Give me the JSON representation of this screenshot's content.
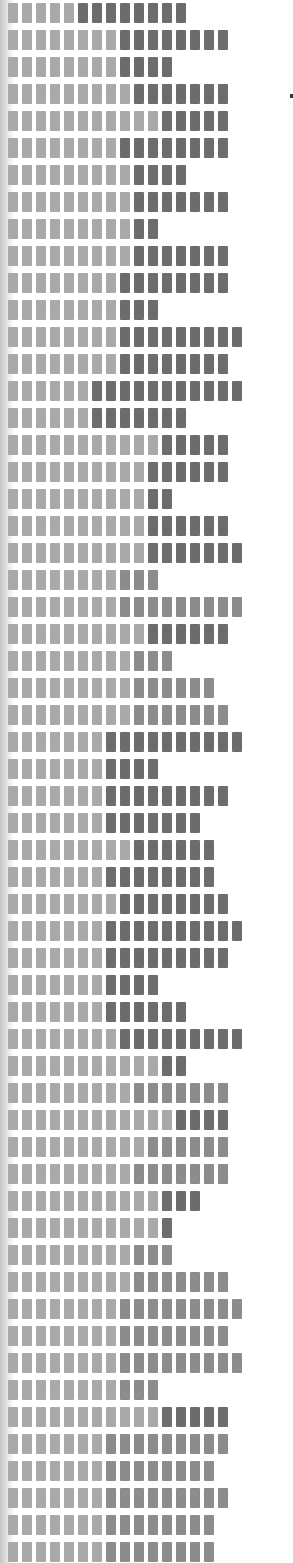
{
  "colors": {
    "light": "#a9a9a9",
    "mid": "#8c8c8c",
    "dark": "#6c6c6c",
    "background": "#ffffff"
  },
  "layout": {
    "row_pitch": 27,
    "first_row_top": 3,
    "block_width": 10,
    "block_height": 20,
    "block_gap": 4
  },
  "rows": [
    {
      "light": 5,
      "dark": 8,
      "tone": "dark"
    },
    {
      "light": 8,
      "dark": 8,
      "tone": "dark"
    },
    {
      "light": 8,
      "dark": 4,
      "tone": "dark"
    },
    {
      "light": 9,
      "dark": 7,
      "tone": "dark"
    },
    {
      "light": 11,
      "dark": 5,
      "tone": "dark"
    },
    {
      "light": 8,
      "dark": 8,
      "tone": "dark"
    },
    {
      "light": 9,
      "dark": 4,
      "tone": "dark"
    },
    {
      "light": 9,
      "dark": 7,
      "tone": "dark"
    },
    {
      "light": 9,
      "dark": 2,
      "tone": "dark"
    },
    {
      "light": 9,
      "dark": 7,
      "tone": "dark"
    },
    {
      "light": 8,
      "dark": 8,
      "tone": "dark"
    },
    {
      "light": 8,
      "dark": 3,
      "tone": "dark"
    },
    {
      "light": 8,
      "dark": 9,
      "tone": "dark"
    },
    {
      "light": 8,
      "dark": 8,
      "tone": "dark"
    },
    {
      "light": 6,
      "dark": 11,
      "tone": "dark"
    },
    {
      "light": 6,
      "dark": 7,
      "tone": "dark"
    },
    {
      "light": 11,
      "dark": 5,
      "tone": "dark"
    },
    {
      "light": 10,
      "dark": 6,
      "tone": "dark"
    },
    {
      "light": 10,
      "dark": 2,
      "tone": "dark"
    },
    {
      "light": 10,
      "dark": 6,
      "tone": "dark"
    },
    {
      "light": 10,
      "dark": 7,
      "tone": "dark"
    },
    {
      "light": 8,
      "dark": 3,
      "tone": "mid"
    },
    {
      "light": 8,
      "dark": 9,
      "tone": "mid"
    },
    {
      "light": 10,
      "dark": 6,
      "tone": "dark"
    },
    {
      "light": 9,
      "dark": 3,
      "tone": "mid"
    },
    {
      "light": 9,
      "dark": 6,
      "tone": "mid"
    },
    {
      "light": 9,
      "dark": 7,
      "tone": "mid"
    },
    {
      "light": 7,
      "dark": 10,
      "tone": "dark"
    },
    {
      "light": 7,
      "dark": 4,
      "tone": "dark"
    },
    {
      "light": 7,
      "dark": 9,
      "tone": "dark"
    },
    {
      "light": 7,
      "dark": 7,
      "tone": "dark"
    },
    {
      "light": 9,
      "dark": 6,
      "tone": "dark"
    },
    {
      "light": 7,
      "dark": 8,
      "tone": "dark"
    },
    {
      "light": 8,
      "dark": 8,
      "tone": "dark"
    },
    {
      "light": 7,
      "dark": 10,
      "tone": "dark"
    },
    {
      "light": 7,
      "dark": 9,
      "tone": "dark"
    },
    {
      "light": 7,
      "dark": 4,
      "tone": "dark"
    },
    {
      "light": 7,
      "dark": 6,
      "tone": "dark"
    },
    {
      "light": 8,
      "dark": 9,
      "tone": "dark"
    },
    {
      "light": 11,
      "dark": 2,
      "tone": "dark"
    },
    {
      "light": 9,
      "dark": 7,
      "tone": "mid"
    },
    {
      "light": 12,
      "dark": 4,
      "tone": "dark"
    },
    {
      "light": 10,
      "dark": 6,
      "tone": "mid"
    },
    {
      "light": 9,
      "dark": 7,
      "tone": "mid"
    },
    {
      "light": 11,
      "dark": 3,
      "tone": "dark"
    },
    {
      "light": 11,
      "dark": 1,
      "tone": "dark"
    },
    {
      "light": 9,
      "dark": 3,
      "tone": "mid"
    },
    {
      "light": 9,
      "dark": 7,
      "tone": "mid"
    },
    {
      "light": 8,
      "dark": 9,
      "tone": "mid"
    },
    {
      "light": 8,
      "dark": 8,
      "tone": "mid"
    },
    {
      "light": 8,
      "dark": 9,
      "tone": "mid"
    },
    {
      "light": 8,
      "dark": 3,
      "tone": "mid"
    },
    {
      "light": 11,
      "dark": 5,
      "tone": "dark"
    },
    {
      "light": 7,
      "dark": 9,
      "tone": "mid"
    },
    {
      "light": 7,
      "dark": 8,
      "tone": "mid"
    },
    {
      "light": 7,
      "dark": 9,
      "tone": "mid"
    },
    {
      "light": 7,
      "dark": 8,
      "tone": "mid"
    },
    {
      "light": 7,
      "dark": 8,
      "tone": "mid"
    }
  ]
}
